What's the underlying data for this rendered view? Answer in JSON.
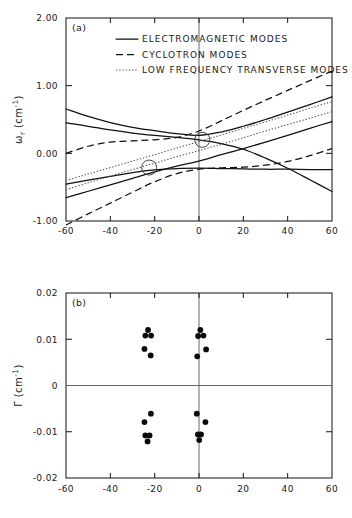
{
  "figure": {
    "panel_a_label": "(a)",
    "panel_b_label": "(b)",
    "legend": [
      {
        "style": "solid",
        "label": "ELECTROMAGNETIC MODES"
      },
      {
        "style": "dashed",
        "label": "CYCLOTRON MODES"
      },
      {
        "style": "dotted",
        "label": "LOW FREQUENCY TRANSVERSE MODES"
      }
    ]
  },
  "axes": {
    "x_ticklabels": [
      "-60",
      "-40",
      "-20",
      "0",
      "20",
      "40",
      "60"
    ],
    "a_y_ticklabels": [
      "2.00",
      "1.00",
      "0.00",
      "-1.00"
    ],
    "b_y_ticklabels": [
      "0.02",
      "0.01",
      "0",
      "-0.01",
      "-0.02"
    ],
    "a_ylabel_main": "ω",
    "a_ylabel_sub": "r",
    "a_ylabel_units": " (cm",
    "a_ylabel_exp": "-1",
    "a_ylabel_close": ")",
    "b_ylabel_main": "Γ",
    "b_ylabel_units": " (cm",
    "b_ylabel_exp": "-1",
    "b_ylabel_close": ")"
  },
  "chart_data": [
    {
      "type": "line",
      "panel": "a",
      "title": "",
      "xlabel": "",
      "ylabel": "ω_r (cm^-1)",
      "xlim": [
        -60,
        60
      ],
      "ylim": [
        -1.0,
        2.0
      ],
      "xticks": [
        -60,
        -40,
        -20,
        0,
        20,
        40,
        60
      ],
      "yticks": [
        -1.0,
        0.0,
        1.0,
        2.0
      ],
      "grid": false,
      "legend_position": "upper-left-inside",
      "annotations": [
        {
          "type": "open-circle-marker",
          "x": 1.5,
          "y": 0.2
        },
        {
          "type": "open-circle-marker",
          "x": -22.5,
          "y": -0.21
        }
      ],
      "series": [
        {
          "name": "ELECTROMAGNETIC MODES",
          "style": "solid",
          "points": [
            [
              -60,
              0.45
            ],
            [
              -50,
              0.4
            ],
            [
              -40,
              0.345
            ],
            [
              -30,
              0.3
            ],
            [
              -20,
              0.265
            ],
            [
              -10,
              0.235
            ],
            [
              0,
              0.2
            ],
            [
              10,
              0.145
            ],
            [
              20,
              0.06
            ],
            [
              30,
              -0.07
            ],
            [
              40,
              -0.22
            ],
            [
              50,
              -0.39
            ],
            [
              60,
              -0.565
            ]
          ]
        },
        {
          "name": "ELECTROMAGNETIC MODES",
          "style": "solid",
          "points": [
            [
              -60,
              0.655
            ],
            [
              -50,
              0.545
            ],
            [
              -40,
              0.455
            ],
            [
              -30,
              0.385
            ],
            [
              -20,
              0.335
            ],
            [
              -10,
              0.29
            ],
            [
              0,
              0.265
            ],
            [
              10,
              0.315
            ],
            [
              20,
              0.4
            ],
            [
              30,
              0.5
            ],
            [
              40,
              0.61
            ],
            [
              50,
              0.72
            ],
            [
              60,
              0.835
            ]
          ]
        },
        {
          "name": "ELECTROMAGNETIC MODES",
          "style": "solid",
          "points": [
            [
              -60,
              -0.455
            ],
            [
              -50,
              -0.395
            ],
            [
              -40,
              -0.34
            ],
            [
              -30,
              -0.285
            ],
            [
              -20,
              -0.245
            ],
            [
              -10,
              -0.225
            ],
            [
              0,
              -0.22
            ],
            [
              10,
              -0.225
            ],
            [
              20,
              -0.23
            ],
            [
              30,
              -0.235
            ],
            [
              40,
              -0.235
            ],
            [
              50,
              -0.24
            ],
            [
              60,
              -0.24
            ]
          ]
        },
        {
          "name": "ELECTROMAGNETIC MODES",
          "style": "solid",
          "points": [
            [
              -60,
              -0.655
            ],
            [
              -50,
              -0.56
            ],
            [
              -40,
              -0.465
            ],
            [
              -30,
              -0.37
            ],
            [
              -20,
              -0.275
            ],
            [
              -10,
              -0.19
            ],
            [
              0,
              -0.115
            ],
            [
              10,
              -0.02
            ],
            [
              20,
              0.07
            ],
            [
              30,
              0.165
            ],
            [
              40,
              0.265
            ],
            [
              50,
              0.37
            ],
            [
              60,
              0.47
            ]
          ]
        },
        {
          "name": "CYCLOTRON MODES",
          "style": "dashed",
          "points": [
            [
              -60,
              0.0
            ],
            [
              -50,
              0.105
            ],
            [
              -40,
              0.165
            ],
            [
              -30,
              0.185
            ],
            [
              -20,
              0.2
            ],
            [
              -10,
              0.235
            ],
            [
              0,
              0.33
            ],
            [
              10,
              0.48
            ],
            [
              20,
              0.635
            ],
            [
              30,
              0.785
            ],
            [
              40,
              0.93
            ],
            [
              50,
              1.075
            ],
            [
              60,
              1.215
            ]
          ]
        },
        {
          "name": "CYCLOTRON MODES",
          "style": "dashed",
          "points": [
            [
              -60,
              -1.06
            ],
            [
              -50,
              -0.895
            ],
            [
              -40,
              -0.735
            ],
            [
              -30,
              -0.575
            ],
            [
              -20,
              -0.42
            ],
            [
              -10,
              -0.3
            ],
            [
              0,
              -0.235
            ],
            [
              10,
              -0.215
            ],
            [
              20,
              -0.205
            ],
            [
              30,
              -0.175
            ],
            [
              40,
              -0.12
            ],
            [
              50,
              -0.035
            ],
            [
              60,
              0.07
            ]
          ]
        },
        {
          "name": "LOW FREQUENCY TRANSVERSE MODES",
          "style": "dotted",
          "points": [
            [
              -60,
              -0.535
            ],
            [
              -50,
              -0.435
            ],
            [
              -40,
              -0.335
            ],
            [
              -30,
              -0.24
            ],
            [
              -20,
              -0.145
            ],
            [
              -10,
              -0.05
            ],
            [
              0,
              0.04
            ],
            [
              10,
              0.135
            ],
            [
              20,
              0.23
            ],
            [
              30,
              0.33
            ],
            [
              40,
              0.425
            ],
            [
              50,
              0.52
            ],
            [
              60,
              0.615
            ]
          ]
        },
        {
          "name": "LOW FREQUENCY TRANSVERSE MODES",
          "style": "dotted",
          "points": [
            [
              -60,
              -0.4
            ],
            [
              -50,
              -0.305
            ],
            [
              -40,
              -0.21
            ],
            [
              -30,
              -0.115
            ],
            [
              -20,
              -0.02
            ],
            [
              -10,
              0.08
            ],
            [
              0,
              0.175
            ],
            [
              10,
              0.27
            ],
            [
              20,
              0.37
            ],
            [
              30,
              0.465
            ],
            [
              40,
              0.565
            ],
            [
              50,
              0.665
            ],
            [
              60,
              0.765
            ]
          ]
        }
      ]
    },
    {
      "type": "scatter",
      "panel": "b",
      "title": "",
      "xlabel": "",
      "ylabel": "Γ (cm^-1)",
      "xlim": [
        -60,
        60
      ],
      "ylim": [
        -0.02,
        0.02
      ],
      "xticks": [
        -60,
        -40,
        -20,
        0,
        20,
        40,
        60
      ],
      "yticks": [
        -0.02,
        -0.01,
        0,
        0.01,
        0.02
      ],
      "grid": false,
      "points": [
        [
          -23.0,
          0.012
        ],
        [
          -24.2,
          0.0108
        ],
        [
          -21.6,
          0.0108
        ],
        [
          -24.6,
          0.0079
        ],
        [
          -21.8,
          0.0065
        ],
        [
          0.6,
          0.012
        ],
        [
          -0.4,
          0.0107
        ],
        [
          2.0,
          0.0108
        ],
        [
          3.2,
          0.0078
        ],
        [
          -0.8,
          0.0063
        ],
        [
          -21.7,
          -0.0061
        ],
        [
          -24.6,
          -0.0079
        ],
        [
          -24.2,
          -0.0108
        ],
        [
          -22.3,
          -0.0108
        ],
        [
          -23.2,
          -0.0121
        ],
        [
          -1.0,
          -0.0061
        ],
        [
          2.9,
          -0.0079
        ],
        [
          -0.5,
          -0.0106
        ],
        [
          0.9,
          -0.0106
        ],
        [
          0.1,
          -0.0118
        ]
      ]
    }
  ]
}
